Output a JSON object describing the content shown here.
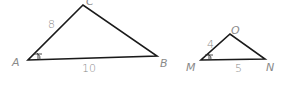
{
  "diagram": {
    "type": "similar-triangles",
    "triangles": [
      {
        "name": "ABC",
        "vertices": {
          "A": {
            "label": "A",
            "x": 28,
            "y": 60
          },
          "B": {
            "label": "B",
            "x": 157,
            "y": 56
          },
          "C": {
            "label": "C",
            "x": 83,
            "y": 5
          }
        },
        "sides": [
          {
            "between": "AC",
            "label": "8"
          },
          {
            "between": "AB",
            "label": "10"
          }
        ],
        "marked_angle": "A"
      },
      {
        "name": "MON",
        "vertices": {
          "M": {
            "label": "M",
            "x": 201,
            "y": 60
          },
          "O": {
            "label": "O",
            "x": 230,
            "y": 34
          },
          "N": {
            "label": "N",
            "x": 265,
            "y": 59
          }
        },
        "sides": [
          {
            "between": "MO",
            "label": "4"
          },
          {
            "between": "MN",
            "label": "5"
          }
        ],
        "marked_angle": "M"
      }
    ]
  }
}
